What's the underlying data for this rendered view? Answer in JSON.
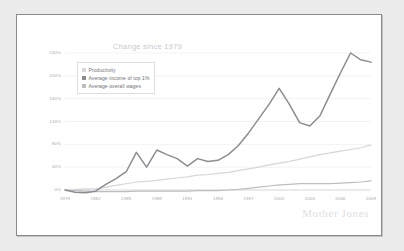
{
  "chart_data": {
    "type": "line",
    "title": "Change since 1979",
    "xlabel": "",
    "ylabel": "",
    "grid": true,
    "legend_position": "top-left",
    "xlim": [
      1979,
      2009
    ],
    "ylim": [
      0,
      240
    ],
    "x_ticks": [
      "1979",
      "1982",
      "1985",
      "1988",
      "1991",
      "1994",
      "1997",
      "2000",
      "2003",
      "2006",
      "2009"
    ],
    "y_ticks": [
      "0%",
      "40%",
      "80%",
      "120%",
      "160%",
      "200%",
      "240%"
    ],
    "x": [
      1979,
      1980,
      1981,
      1982,
      1983,
      1984,
      1985,
      1986,
      1987,
      1988,
      1989,
      1990,
      1991,
      1992,
      1993,
      1994,
      1995,
      1996,
      1997,
      1998,
      1999,
      2000,
      2001,
      2002,
      2003,
      2004,
      2005,
      2006,
      2007,
      2008,
      2009
    ],
    "series": [
      {
        "name": "Average income of top 1%",
        "color": "#8c8c92",
        "values": [
          0,
          -4,
          -5,
          -2,
          10,
          20,
          32,
          66,
          40,
          70,
          62,
          55,
          42,
          55,
          50,
          52,
          62,
          78,
          100,
          125,
          150,
          178,
          150,
          118,
          112,
          130,
          168,
          205,
          240,
          228,
          224
        ]
      },
      {
        "name": "Productivity",
        "color": "#d7d7da",
        "values": [
          0,
          1,
          2,
          2,
          5,
          8,
          11,
          14,
          15,
          17,
          19,
          21,
          23,
          26,
          27,
          29,
          31,
          34,
          37,
          40,
          44,
          47,
          50,
          54,
          58,
          62,
          65,
          68,
          71,
          74,
          79
        ]
      },
      {
        "name": "Average overall wages",
        "color": "#bdbdc2",
        "values": [
          0,
          -1,
          -2,
          -3,
          -3,
          -3,
          -3,
          -2,
          -2,
          -2,
          -2,
          -2,
          -2,
          -1,
          -1,
          -1,
          0,
          1,
          3,
          5,
          7,
          9,
          10,
          11,
          11,
          11,
          11,
          12,
          13,
          14,
          16
        ]
      }
    ]
  },
  "legend": {
    "items": [
      {
        "label": "Productivity",
        "color": "#d7d7da"
      },
      {
        "label": "Average income of top 1%",
        "color": "#8c8c92"
      },
      {
        "label": "Average overall wages",
        "color": "#bdbdc2"
      }
    ]
  },
  "watermark": {
    "text": "Mother Jones"
  }
}
